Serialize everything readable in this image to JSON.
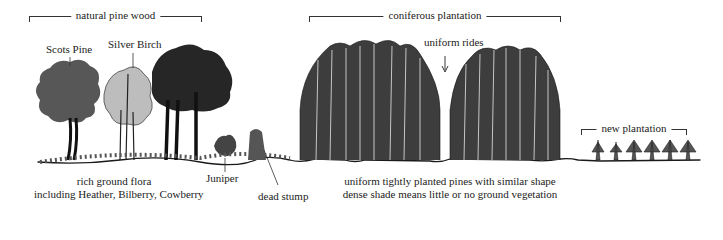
{
  "sections": {
    "natural": {
      "label": "natural pine wood"
    },
    "coniferous": {
      "label": "coniferous plantation"
    },
    "new": {
      "label": "new plantation"
    }
  },
  "tree_labels": {
    "scots_pine": "Scots Pine",
    "silver_birch": "Silver Birch",
    "uniform_rides": "uniform rides",
    "juniper": "Juniper",
    "dead_stump": "dead stump"
  },
  "captions": {
    "ground_flora_line1": "rich ground flora",
    "ground_flora_line2": "including Heather, Bilberry, Cowberry",
    "plantation_line1": "uniform tightly planted pines with similar shape",
    "plantation_line2": "dense shade means little or no ground vegetation"
  },
  "colors": {
    "ink": "#1a1a1a",
    "background": "#ffffff"
  }
}
